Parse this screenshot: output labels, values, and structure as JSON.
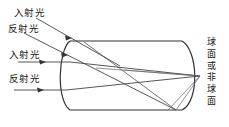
{
  "figure": {
    "type": "optics-ray-diagram",
    "title": "",
    "labels": {
      "incident_upper": "入射光",
      "reflected_upper": "反射光",
      "incident_lower": "入射光",
      "reflected_lower": "反射光",
      "surface_type": "球面或非球面"
    },
    "colors": {
      "stroke": "#333333",
      "ray": "#444444",
      "background": "#ffffff"
    },
    "element": {
      "name": "barrel-optical-element",
      "top_y": 41,
      "bottom_y": 110,
      "left_x": 62,
      "right_x": 189,
      "left_edge": "convex-arc",
      "right_edge": "convex-arc"
    },
    "focal_point": {
      "x": 200,
      "y": 76
    },
    "rays": [
      {
        "name": "incident-upper-ray",
        "kind": "incident",
        "x1": 36,
        "y1": 18,
        "x2": 118,
        "y2": 64,
        "arrow_at": 0.45
      },
      {
        "name": "reflected-upper-ray",
        "kind": "reflected",
        "x1": 24,
        "y1": 32,
        "x2": 176,
        "y2": 110,
        "arrow_at": 0.4
      },
      {
        "name": "incident-lower-ray",
        "kind": "incident",
        "x1": 18,
        "y1": 62,
        "x2": 200,
        "y2": 76,
        "arrow_at": 0.32
      },
      {
        "name": "reflected-lower-ray",
        "kind": "reflected",
        "x1": 14,
        "y1": 90,
        "x2": 200,
        "y2": 76,
        "arrow_at": 0.28
      }
    ]
  }
}
